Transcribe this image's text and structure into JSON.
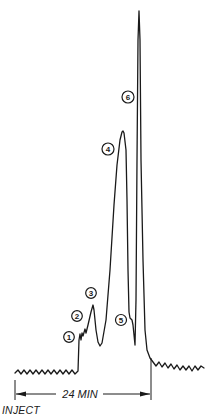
{
  "chart_data": {
    "type": "line",
    "title": "",
    "xlabel": "",
    "ylabel": "",
    "grid": false,
    "time_span_label": "24 MIN",
    "start_label": "INJECT",
    "peaks": [
      {
        "id": "1",
        "label": "1",
        "relative_height": 0.09
      },
      {
        "id": "2",
        "label": "2",
        "relative_height": 0.12
      },
      {
        "id": "3",
        "label": "3",
        "relative_height": 0.19
      },
      {
        "id": "4",
        "label": "4",
        "relative_height": 0.68
      },
      {
        "id": "5",
        "label": "5",
        "relative_height": 0.15
      },
      {
        "id": "6",
        "label": "6",
        "relative_height": 1.0
      }
    ],
    "trace_points": [
      [
        15,
        373
      ],
      [
        18,
        370
      ],
      [
        21,
        374
      ],
      [
        24,
        370
      ],
      [
        27,
        374
      ],
      [
        30,
        370
      ],
      [
        33,
        374
      ],
      [
        36,
        370
      ],
      [
        39,
        374
      ],
      [
        42,
        370
      ],
      [
        45,
        374
      ],
      [
        48,
        370
      ],
      [
        51,
        374
      ],
      [
        54,
        370
      ],
      [
        57,
        374
      ],
      [
        60,
        370
      ],
      [
        63,
        374
      ],
      [
        66,
        370
      ],
      [
        69,
        374
      ],
      [
        72,
        370
      ],
      [
        75,
        374
      ],
      [
        78,
        371
      ],
      [
        79,
        340
      ],
      [
        80,
        334
      ],
      [
        81,
        340
      ],
      [
        82,
        333
      ],
      [
        83,
        336
      ],
      [
        85,
        329
      ],
      [
        86,
        333
      ],
      [
        88,
        325
      ],
      [
        91,
        312
      ],
      [
        93,
        305
      ],
      [
        94,
        310
      ],
      [
        96,
        330
      ],
      [
        98,
        342
      ],
      [
        100,
        346
      ],
      [
        102,
        343
      ],
      [
        106,
        320
      ],
      [
        110,
        270
      ],
      [
        114,
        205
      ],
      [
        117,
        165
      ],
      [
        120,
        140
      ],
      [
        122,
        132
      ],
      [
        123,
        131
      ],
      [
        124,
        133
      ],
      [
        126,
        150
      ],
      [
        127,
        200
      ],
      [
        128,
        270
      ],
      [
        129,
        312
      ],
      [
        130,
        318
      ],
      [
        132,
        320
      ],
      [
        133,
        325
      ],
      [
        134,
        335
      ],
      [
        135,
        345
      ],
      [
        136,
        300
      ],
      [
        137,
        160
      ],
      [
        138,
        40
      ],
      [
        139,
        11
      ],
      [
        140,
        40
      ],
      [
        141,
        160
      ],
      [
        143,
        260
      ],
      [
        145,
        330
      ],
      [
        147,
        350
      ],
      [
        150,
        358
      ],
      [
        153,
        362
      ],
      [
        156,
        366
      ],
      [
        159,
        362
      ],
      [
        162,
        367
      ],
      [
        165,
        363
      ],
      [
        168,
        368
      ],
      [
        171,
        364
      ],
      [
        174,
        369
      ],
      [
        177,
        365
      ],
      [
        180,
        370
      ],
      [
        183,
        366
      ],
      [
        186,
        370
      ],
      [
        189,
        366
      ],
      [
        192,
        371
      ],
      [
        195,
        366
      ],
      [
        198,
        370
      ],
      [
        201,
        366
      ],
      [
        204,
        368
      ]
    ]
  },
  "labels": {
    "peak_1": "1",
    "peak_2": "2",
    "peak_3": "3",
    "peak_4": "4",
    "peak_5": "5",
    "peak_6": "6",
    "duration": "24 MIN",
    "inject": "INJECT"
  },
  "colors": {
    "ink": "#1a1a1a",
    "background": "#ffffff"
  }
}
